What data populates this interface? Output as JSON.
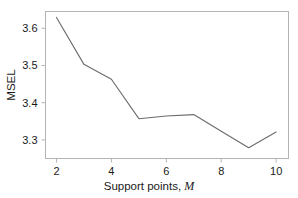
{
  "chart_data": {
    "type": "line",
    "title": "",
    "subtitle": "",
    "xlabel_text": "Support points, ",
    "xlabel_symbol": "M",
    "ylabel": "MSEL",
    "x": [
      2,
      3,
      4,
      5,
      6,
      7,
      8,
      9,
      10
    ],
    "values": [
      3.629,
      3.503,
      3.463,
      3.357,
      3.364,
      3.368,
      3.323,
      3.279,
      3.321
    ],
    "series": [
      {
        "name": "MSEL",
        "values": [
          3.629,
          3.503,
          3.463,
          3.357,
          3.364,
          3.368,
          3.323,
          3.279,
          3.321
        ]
      }
    ],
    "xlim": [
      1.6,
      10.45
    ],
    "ylim": [
      3.25,
      3.645
    ],
    "xticks": [
      2,
      4,
      6,
      8,
      10
    ],
    "xtick_labels": [
      "2",
      "4",
      "6",
      "8",
      "10"
    ],
    "yticks": [
      3.3,
      3.4,
      3.5,
      3.6
    ],
    "ytick_labels": [
      "3.3",
      "3.4",
      "3.5",
      "3.6"
    ],
    "grid": false,
    "legend": false,
    "legend_position": "none",
    "line_color": "#6b6b6b",
    "frame_color": "#b4b4b4",
    "background_color": "#ffffff",
    "annotations": []
  }
}
